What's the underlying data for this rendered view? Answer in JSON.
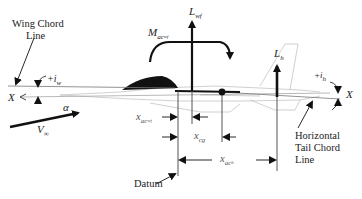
{
  "diagram": {
    "type": "aircraft-longitudinal-force-diagram",
    "labels": {
      "wing_chord_line_1": "Wing Chord",
      "wing_chord_line_2": "Line",
      "i_w_sign": "+",
      "i_w_sym": "i",
      "i_w_sub": "w",
      "x_left": "X",
      "x_right": "X",
      "alpha": "α",
      "v_inf_sym": "V",
      "v_inf_sub": "∞",
      "moment_sym": "M",
      "moment_sub": "ac",
      "moment_subsub": "wf",
      "lift_wf_sym": "L",
      "lift_wf_sub": "wf",
      "lift_h_sym": "L",
      "lift_h_sub": "h",
      "i_h_sign": "+",
      "i_h_sym": "i",
      "i_h_sub": "h",
      "x_acwf_sym": "x",
      "x_acwf_sub": "ac",
      "x_acwf_subsub": "wf",
      "x_cg_sym": "x",
      "x_cg_sub": "cg",
      "x_ach_sym": "x",
      "x_ach_sub": "ac",
      "x_ach_subsub": "h",
      "datum": "Datum",
      "htail_1": "Horizontal",
      "htail_2": "Tail Chord",
      "htail_3": "Line"
    },
    "colors": {
      "ink": "#111111",
      "aircraft_outline": "#bdbdbd",
      "text": "#222222"
    }
  }
}
